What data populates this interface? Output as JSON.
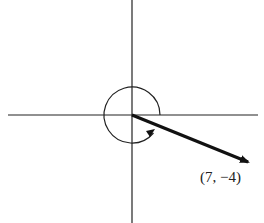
{
  "diagram": {
    "type": "vector-angle-diagram",
    "axes": {
      "horizontal": true,
      "vertical": true
    },
    "vector": {
      "from": "origin",
      "to_label": "(7, −4)",
      "x": 7,
      "y": -4
    },
    "angle_arc": {
      "direction": "counterclockwise",
      "from": "positive x-axis",
      "to": "vector"
    },
    "point_label": "(7, −4)"
  },
  "colors": {
    "stroke": "#1a1a1a",
    "background": "#ffffff"
  }
}
